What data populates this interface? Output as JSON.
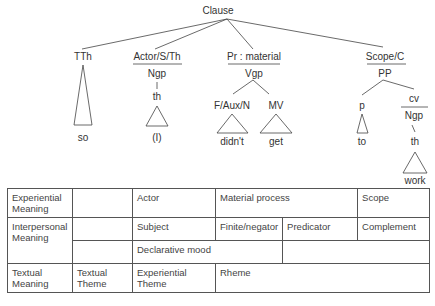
{
  "tree": {
    "root": "Clause",
    "nodes": {
      "tth": "TTh",
      "actor_func": "Actor/S/Th",
      "actor_form": "Ngp",
      "actor_th": "th",
      "actor_word": "(I)",
      "tth_word": "so",
      "pr_func": "Pr : material",
      "pr_form": "Vgp",
      "faux": "F/Aux/N",
      "mv": "MV",
      "faux_word": "didn't",
      "mv_word": "get",
      "scope_func": "Scope/C",
      "scope_form": "PP",
      "p": "p",
      "p_word": "to",
      "cv": "cv",
      "cv_form": "Ngp",
      "cv_th": "th",
      "cv_word": "work"
    }
  },
  "table": {
    "rows": [
      {
        "label": "Experiential Meaning",
        "cells": [
          "",
          "Actor",
          "Material process",
          "Scope"
        ]
      },
      {
        "label": "Interpersonal Meaning",
        "cells": [
          "",
          "Subject",
          "Finite/negator",
          "Predicator",
          "Complement"
        ]
      },
      {
        "label": "",
        "cells": [
          "",
          "Declarative mood",
          ""
        ]
      },
      {
        "label": "Textual Meaning",
        "cells": [
          "Textual Theme",
          "Experiential Theme",
          "Rheme"
        ]
      }
    ]
  }
}
